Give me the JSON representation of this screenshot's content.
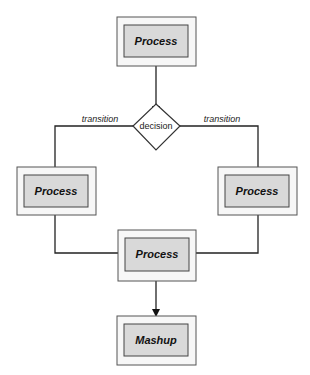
{
  "diagram": {
    "nodes": [
      {
        "id": "process-top",
        "label": "Process",
        "type": "process"
      },
      {
        "id": "decision",
        "label": "decision",
        "type": "decision"
      },
      {
        "id": "process-left",
        "label": "Process",
        "type": "process"
      },
      {
        "id": "process-right",
        "label": "Process",
        "type": "process"
      },
      {
        "id": "process-merge",
        "label": "Process",
        "type": "process"
      },
      {
        "id": "mashup",
        "label": "Mashup",
        "type": "process"
      }
    ],
    "edges": [
      {
        "from": "process-top",
        "to": "decision",
        "label": ""
      },
      {
        "from": "decision",
        "to": "process-left",
        "label": "transition"
      },
      {
        "from": "decision",
        "to": "process-right",
        "label": "transition"
      },
      {
        "from": "process-left",
        "to": "process-merge",
        "label": ""
      },
      {
        "from": "process-right",
        "to": "process-merge",
        "label": ""
      },
      {
        "from": "process-merge",
        "to": "mashup",
        "label": ""
      }
    ],
    "labels": {
      "process_top": "Process",
      "decision": "decision",
      "transition_left": "transition",
      "transition_right": "transition",
      "process_left": "Process",
      "process_right": "Process",
      "process_merge": "Process",
      "mashup": "Mashup"
    },
    "colors": {
      "outer_fill": "#f7f7f7",
      "inner_fill": "#d9d9d9",
      "stroke": "#333333"
    }
  }
}
